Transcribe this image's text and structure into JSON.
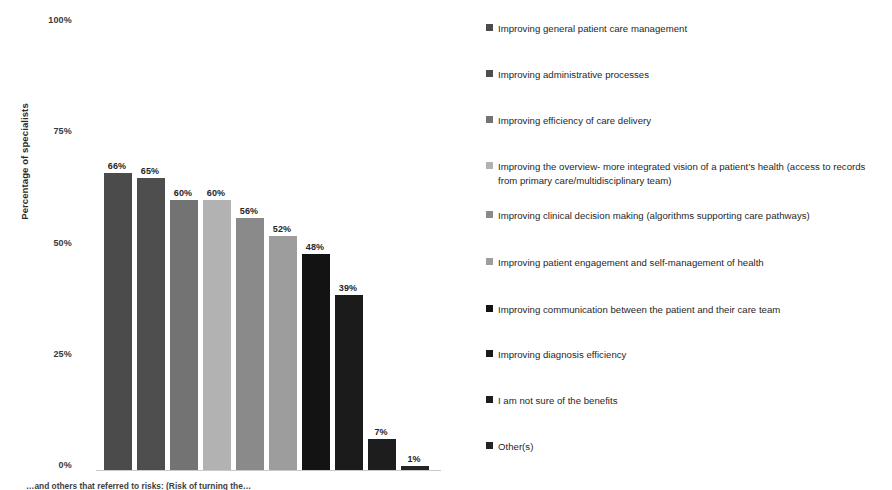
{
  "chart_data": {
    "type": "bar",
    "title": "",
    "xlabel": "",
    "ylabel": "Percentage of specialists",
    "ylim": [
      0,
      100
    ],
    "ytick_labels": [
      "100%",
      "75%",
      "50%",
      "25%",
      "0%"
    ],
    "ytick_values": [
      100,
      75,
      50,
      25,
      0
    ],
    "grid": false,
    "legend_position": "right",
    "categories": [
      "Improving general patient care management",
      "Improving administrative processes",
      "Improving efficiency of care delivery",
      "Improving the overview- more integrated vision of a patient's health (access to records from primary care/multidisciplinary team)",
      "Improving clinical decision making (algorithms supporting care pathways)",
      "Improving patient engagement and self-management of health",
      "Improving communication between the patient and their care team",
      "Improving diagnosis efficiency",
      "I am not sure of the benefits",
      "Other(s)"
    ],
    "values": [
      66,
      65,
      60,
      60,
      56,
      52,
      48,
      39,
      7,
      1
    ],
    "value_labels": [
      "66%",
      "65%",
      "60%",
      "60%",
      "56%",
      "52%",
      "48%",
      "39%",
      "7%",
      "1%"
    ],
    "colors": [
      "#4b4b4b",
      "#4e4e4e",
      "#737373",
      "#b2b2b2",
      "#8a8a8a",
      "#9d9d9d",
      "#131313",
      "#1b1b1b",
      "#1d1d1d",
      "#242424"
    ]
  },
  "legend": {
    "items": [
      {
        "label": "Improving general patient care management",
        "color": "#4b4b4b"
      },
      {
        "label": "Improving administrative processes",
        "color": "#4e4e4e"
      },
      {
        "label": "Improving efficiency of care delivery",
        "color": "#737373"
      },
      {
        "label": "Improving the overview- more integrated vision of a patient’s health (access to records from primary care/multidisciplinary team)",
        "color": "#b2b2b2"
      },
      {
        "label": "Improving clinical decision making (algorithms supporting care pathways)",
        "color": "#8a8a8a"
      },
      {
        "label": "Improving patient engagement and self-management of health",
        "color": "#9d9d9d"
      },
      {
        "label": "Improving communication between the patient and their care team",
        "color": "#131313"
      },
      {
        "label": "Improving diagnosis efficiency",
        "color": "#1b1b1b"
      },
      {
        "label": "I am not sure of the benefits",
        "color": "#1d1d1d"
      },
      {
        "label": "Other(s)",
        "color": "#242424"
      }
    ]
  },
  "caption": {
    "text": "…and others that referred to risks: (Risk of turning the…"
  }
}
